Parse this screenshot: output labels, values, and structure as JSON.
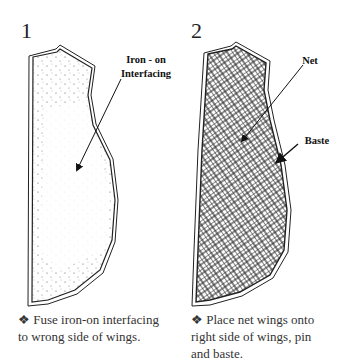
{
  "steps": [
    {
      "number": "1",
      "labels": [
        "Iron - on",
        "Interfacing"
      ],
      "bullet": "❖",
      "caption_lines": [
        "Fuse iron-on interfacing",
        "to wrong side of wings."
      ]
    },
    {
      "number": "2",
      "labels": [
        "Net",
        "Baste"
      ],
      "bullet": "❖",
      "caption_lines": [
        "Place net wings onto",
        "right side of wings, pin",
        "and baste."
      ]
    }
  ]
}
